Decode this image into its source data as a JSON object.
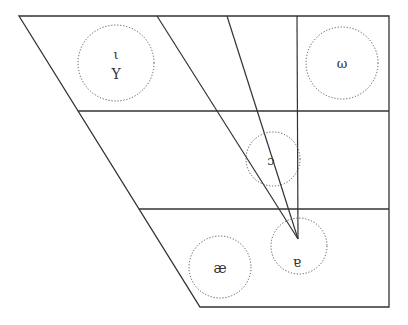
{
  "diagram": {
    "type": "vowel-chart",
    "colors": {
      "stroke": "#333333",
      "circle_stroke": "#555555",
      "background": "#ffffff"
    },
    "outline": {
      "top_left": [
        19,
        16
      ],
      "top_right": [
        389,
        16
      ],
      "bottom_right": [
        389,
        307
      ],
      "bottom_left": [
        200,
        307
      ]
    },
    "horizontal_lines": [
      {
        "y": 111,
        "x1": 78,
        "x2": 389
      },
      {
        "y": 209,
        "x1": 139,
        "x2": 389
      }
    ],
    "radiating_lines": [
      {
        "from": [
          157,
          16
        ],
        "to": [
          298,
          239
        ]
      },
      {
        "from": [
          227,
          16
        ],
        "to": [
          298,
          239
        ]
      },
      {
        "from": [
          297,
          16
        ],
        "to": [
          298,
          239
        ]
      }
    ],
    "vowels": [
      {
        "symbols": [
          "ι",
          "Y"
        ],
        "cx": 116,
        "cy": 63,
        "r": 38
      },
      {
        "symbols": [
          "ω"
        ],
        "cx": 342,
        "cy": 63,
        "r": 36
      },
      {
        "symbols": [
          "ɔ"
        ],
        "cx": 273,
        "cy": 159,
        "r": 27
      },
      {
        "symbols": [
          "æ"
        ],
        "cx": 220,
        "cy": 267,
        "r": 31
      },
      {
        "symbols": [
          "ɐ"
        ],
        "cx": 299,
        "cy": 246,
        "r": 28
      }
    ]
  }
}
